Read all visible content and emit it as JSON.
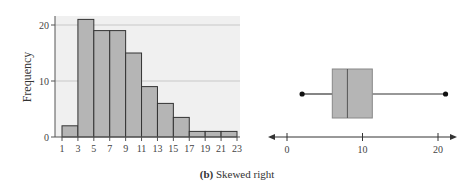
{
  "caption": {
    "label": "(b)",
    "text": "Skewed right"
  },
  "chart_data": [
    {
      "type": "bar",
      "title": "",
      "xlabel": "",
      "ylabel": "Frequency",
      "categories": [
        "1-3",
        "3-5",
        "5-7",
        "7-9",
        "9-11",
        "11-13",
        "13-15",
        "15-17",
        "17-19",
        "19-21",
        "21-23"
      ],
      "bin_edges": [
        1,
        3,
        5,
        7,
        9,
        11,
        13,
        15,
        17,
        19,
        21,
        23
      ],
      "values": [
        2,
        21,
        19,
        19,
        15,
        9,
        6,
        3.5,
        1,
        1,
        1
      ],
      "ylim": [
        0,
        21
      ],
      "yticks": [
        0,
        10,
        20
      ],
      "xticks": [
        1,
        3,
        5,
        7,
        9,
        11,
        13,
        15,
        17,
        19,
        21,
        23
      ],
      "grid": true,
      "bar_color": "#b5b5b5",
      "bar_edge": "#333333",
      "background": "#f0f0f0"
    },
    {
      "type": "boxplot",
      "title": "",
      "min": 2,
      "q1": 6,
      "median": 8,
      "q3": 11.3,
      "max": 21,
      "xticks": [
        0,
        10,
        20
      ],
      "xlim": [
        -2,
        22
      ],
      "box_color": "#b5b5b5"
    }
  ]
}
